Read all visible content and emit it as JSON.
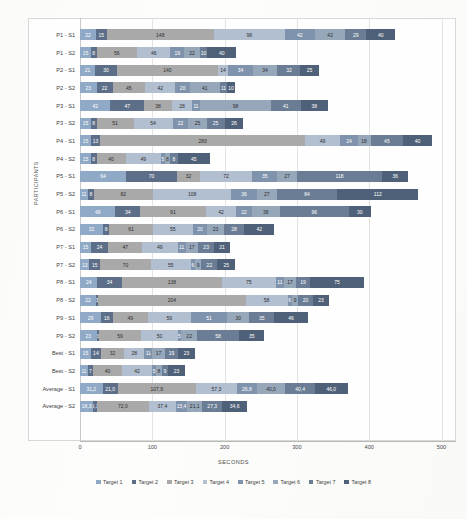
{
  "chart_data": {
    "type": "bar",
    "orientation": "horizontal",
    "stacked": true,
    "title": "",
    "xlabel": "SECONDS",
    "ylabel": "PARTICIPANTS",
    "xlim": [
      0,
      520
    ],
    "xticks": [
      "0",
      "100",
      "200",
      "300",
      "400",
      "500"
    ],
    "xtick_values": [
      0,
      100,
      200,
      300,
      400,
      500
    ],
    "grid": true,
    "legend_position": "bottom",
    "legend": [
      "Target 1",
      "Target 2",
      "Target 3",
      "Target 4",
      "Target 5",
      "Target 6",
      "Target 7",
      "Target 8"
    ],
    "colors": [
      "#8fa9c6",
      "#5d6f88",
      "#a9a9a9",
      "#b2bfd0",
      "#7f93ad",
      "#97a7ba",
      "#6a7d95",
      "#4f6178"
    ],
    "categories": [
      "P1 - S1",
      "P1 - S2",
      "P2 - S1",
      "P2 - S2",
      "P3 - S1",
      "P3 - S2",
      "P4 - S1",
      "P4 - S2",
      "P5 - S1",
      "P5 - S2",
      "P6 - S1",
      "P6 - S2",
      "P7 - S1",
      "P7 - S2",
      "P8 - S1",
      "P8 - S2",
      "P9 - S1",
      "P9 - S2",
      "Best - S1",
      "Best - S2",
      "Average - S1",
      "Average - S2"
    ],
    "series": [
      {
        "name": "Target 1",
        "values": [
          22,
          15,
          21,
          23,
          42,
          15,
          15,
          15,
          64,
          11,
          49,
          32,
          15,
          13,
          24,
          22,
          29,
          23,
          15,
          11,
          31.2,
          18.3
        ]
      },
      {
        "name": "Target 2",
        "values": [
          15,
          8,
          30,
          22,
          47,
          8,
          13,
          8,
          70,
          8,
          34,
          8,
          24,
          15,
          34,
          3,
          16,
          3,
          14,
          7,
          21.0,
          5.1
        ]
      },
      {
        "name": "Target 3",
        "values": [
          148,
          56,
          140,
          45,
          38,
          51,
          283,
          40,
          32,
          82,
          91,
          61,
          47,
          70,
          138,
          204,
          49,
          59,
          32,
          40,
          107.9,
          72.0
        ]
      },
      {
        "name": "Target 4",
        "values": [
          98,
          46,
          14,
          42,
          28,
          54,
          49,
          49,
          72,
          108,
          42,
          55,
          49,
          55,
          75,
          58,
          59,
          50,
          28,
          42,
          57.3,
          37.4
        ]
      },
      {
        "name": "Target 5",
        "values": [
          42,
          19,
          34,
          20,
          11,
          22,
          24,
          5,
          35,
          36,
          22,
          20,
          11,
          6,
          11,
          6,
          51,
          5,
          11,
          5,
          26.8,
          15.4
        ]
      },
      {
        "name": "Target 6",
        "values": [
          42,
          22,
          34,
          41,
          98,
          25,
          18,
          8,
          27,
          27,
          38,
          23,
          17,
          9,
          17,
          9,
          30,
          22,
          17,
          8,
          40.0,
          21.1
        ]
      },
      {
        "name": "Target 7",
        "values": [
          29,
          10,
          32,
          11,
          41,
          25,
          45,
          10,
          118,
          84,
          96,
          28,
          23,
          22,
          19,
          20,
          35,
          58,
          19,
          9,
          40.4,
          27.3
        ]
      },
      {
        "name": "Target 8",
        "values": [
          40,
          40,
          25,
          10,
          38,
          26,
          40,
          45,
          36,
          112,
          30,
          42,
          21,
          25,
          75,
          23,
          46,
          35,
          23,
          23,
          46.0,
          34.6
        ]
      }
    ],
    "bar_labels": [
      [
        "22",
        "15",
        "148",
        "98",
        "42",
        "42",
        "29",
        "40"
      ],
      [
        "15",
        "8",
        "56",
        "46",
        "19",
        "22",
        "10",
        "40"
      ],
      [
        "21",
        "30",
        "140",
        "14",
        "34",
        "34",
        "32",
        "25"
      ],
      [
        "23",
        "22",
        "45",
        "42",
        "20",
        "41",
        "11",
        "10"
      ],
      [
        "42",
        "47",
        "38",
        "28",
        "11",
        "98",
        "41",
        "38"
      ],
      [
        "15",
        "8",
        "51",
        "54",
        "22",
        "25",
        "25",
        "26"
      ],
      [
        "15",
        "13",
        "283",
        "49",
        "24",
        "18",
        "45",
        "40"
      ],
      [
        "15",
        "8",
        "40",
        "49",
        "5",
        "8",
        "8",
        "45"
      ],
      [
        "64",
        "70",
        "32",
        "72",
        "35",
        "27",
        "118",
        "36"
      ],
      [
        "11",
        "8",
        "82",
        "108",
        "36",
        "27",
        "84",
        "112"
      ],
      [
        "49",
        "34",
        "91",
        "42",
        "22",
        "38",
        "96",
        "30"
      ],
      [
        "32",
        "8",
        "61",
        "55",
        "20",
        "23",
        "28",
        "42"
      ],
      [
        "15",
        "24",
        "47",
        "49",
        "11",
        "17",
        "23",
        "21"
      ],
      [
        "13",
        "15",
        "70",
        "55",
        "6",
        "9",
        "22",
        "25"
      ],
      [
        "24",
        "34",
        "138",
        "75",
        "11",
        "17",
        "19",
        "75"
      ],
      [
        "22",
        "3",
        "204",
        "58",
        "6",
        "9",
        "20",
        "23"
      ],
      [
        "29",
        "16",
        "49",
        "59",
        "51",
        "30",
        "35",
        "46"
      ],
      [
        "23",
        "3",
        "59",
        "50",
        "5",
        "22",
        "58",
        "35"
      ],
      [
        "15",
        "14",
        "32",
        "28",
        "11",
        "17",
        "19",
        "23"
      ],
      [
        "11",
        "7",
        "40",
        "42",
        "5",
        "8",
        "9",
        "23"
      ],
      [
        "31,2",
        "21,0",
        "107,9",
        "57,3",
        "26,8",
        "40,0",
        "40,4",
        "46,0"
      ],
      [
        "18,3",
        "5,1",
        "72,0",
        "37,4",
        "15,4",
        "21,1",
        "27,3",
        "34,6"
      ]
    ]
  }
}
